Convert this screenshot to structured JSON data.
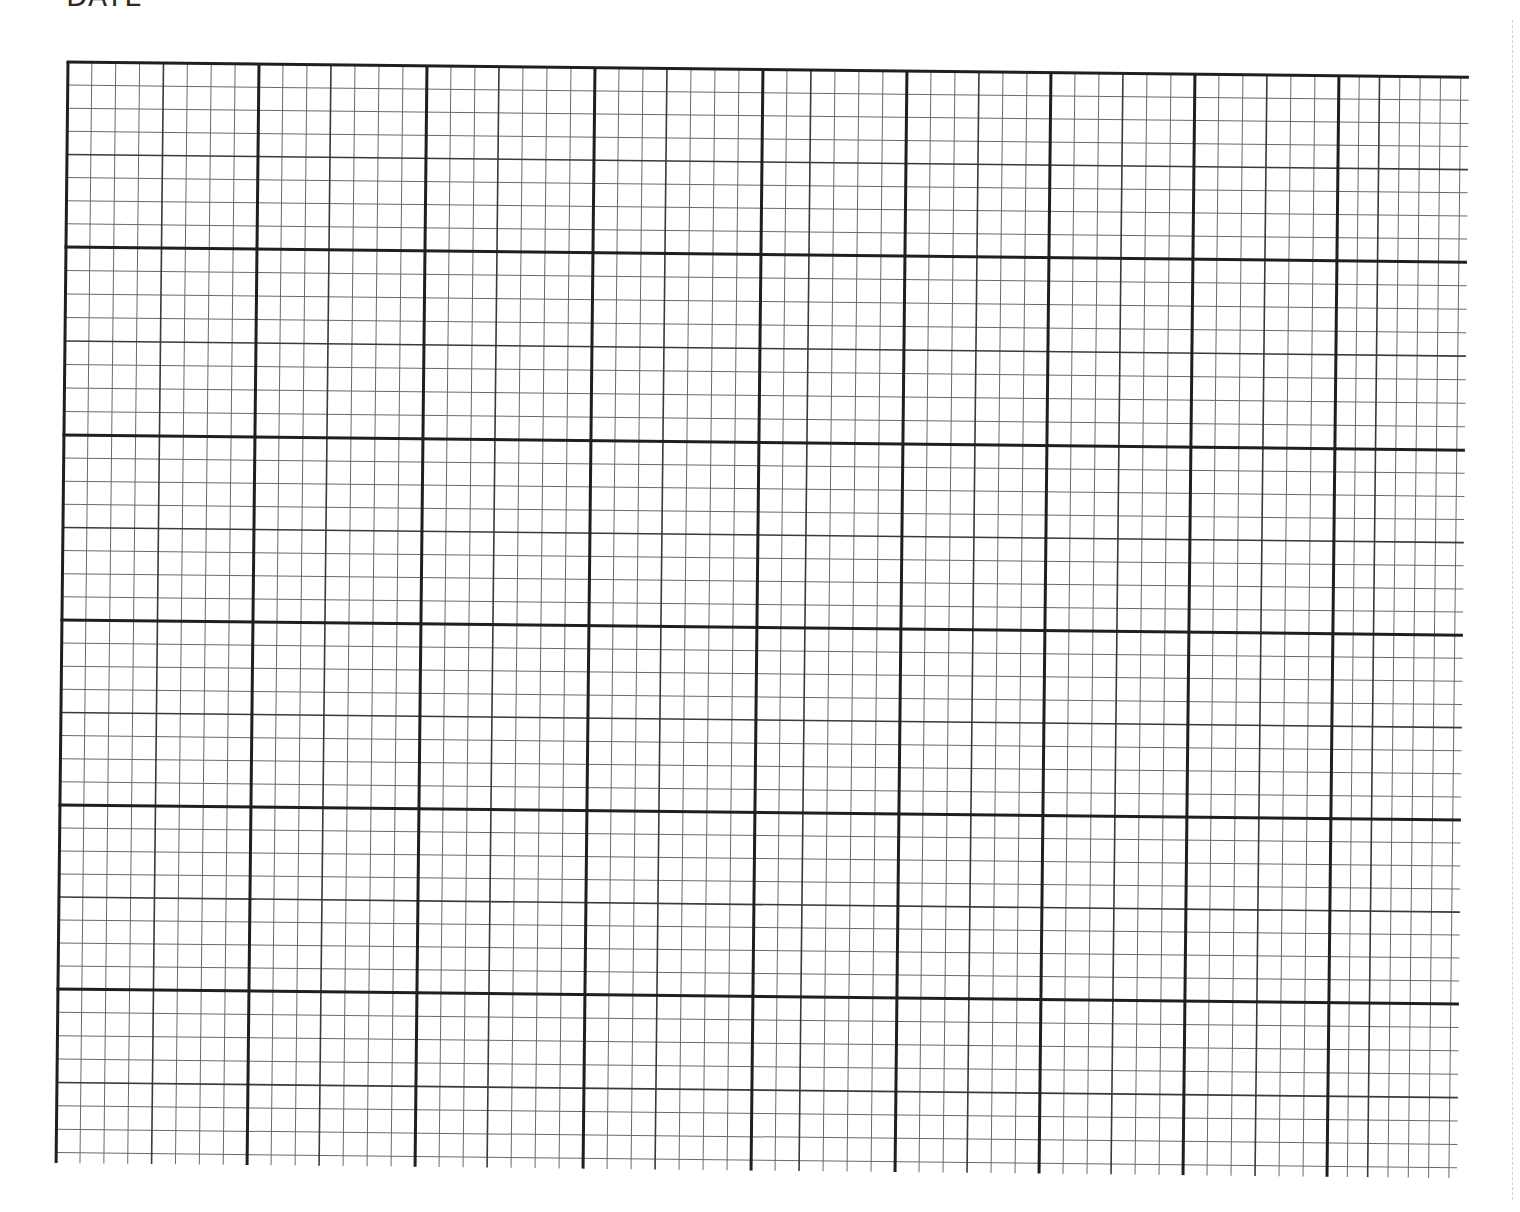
{
  "sheet": {
    "label": "DATE",
    "colors": {
      "paper": "#ffffff",
      "major_line": "#1f1f1f",
      "medium_line": "#3a3a3a",
      "minor_line": "#6a6a6a",
      "perforation": "#c9c9c9"
    }
  },
  "grid": {
    "origin_x": 68,
    "origin_y": 62,
    "rotation_deg": 0.62,
    "major_stroke": 3,
    "medium_stroke": 1.6,
    "minor_stroke": 1,
    "bottom_overhang": 8,
    "columns": [
      {
        "width": 191,
        "subdivisions": 8,
        "medium_at": 4
      },
      {
        "width": 168,
        "subdivisions": 7,
        "medium_at": 3
      },
      {
        "width": 168,
        "subdivisions": 7,
        "medium_at": 3
      },
      {
        "width": 168,
        "subdivisions": 7,
        "medium_at": 3
      },
      {
        "width": 144,
        "subdivisions": 6,
        "medium_at": 2
      },
      {
        "width": 144,
        "subdivisions": 6,
        "medium_at": 3
      },
      {
        "width": 144,
        "subdivisions": 6,
        "medium_at": 3
      },
      {
        "width": 144,
        "subdivisions": 6,
        "medium_at": 3
      },
      {
        "width": 130,
        "subdivisions": 6,
        "medium_at": 2,
        "open_end": true
      }
    ],
    "rows": [
      {
        "height": 185,
        "subdivisions": 8,
        "medium_at": 4
      },
      {
        "height": 188,
        "subdivisions": 8,
        "medium_at": 4
      },
      {
        "height": 185,
        "subdivisions": 8,
        "medium_at": 4
      },
      {
        "height": 185,
        "subdivisions": 8,
        "medium_at": 4
      },
      {
        "height": 184,
        "subdivisions": 8,
        "medium_at": 4
      },
      {
        "height": 166,
        "subdivisions": 7,
        "medium_at": 4,
        "open_end": true
      }
    ]
  }
}
